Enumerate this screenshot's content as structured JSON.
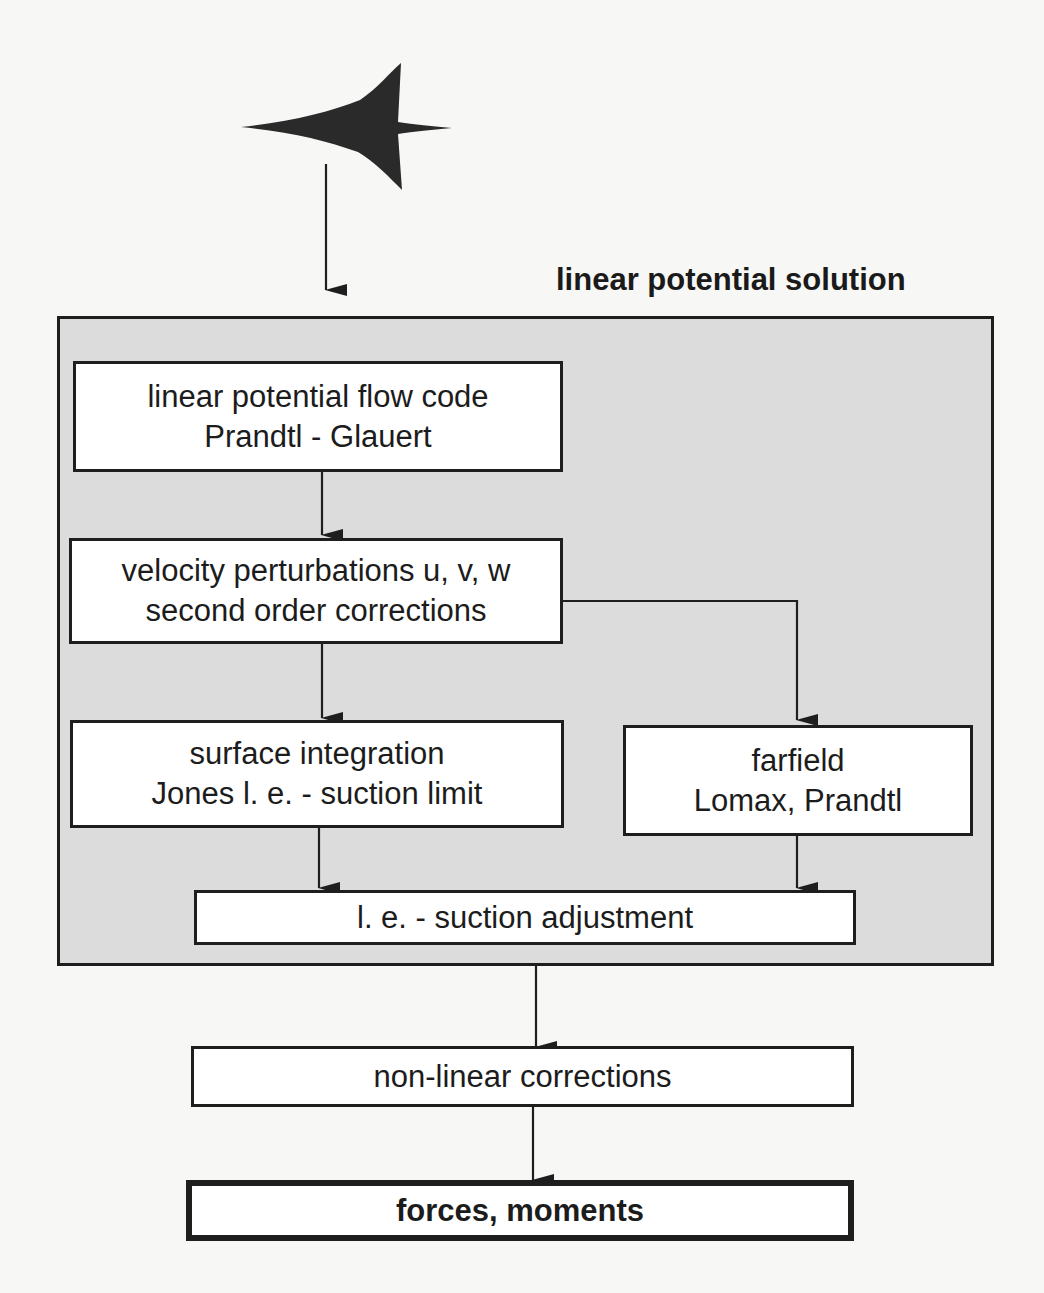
{
  "diagram": {
    "region": {
      "title": "linear potential solution"
    },
    "nodes": {
      "aircraft": {
        "icon": "aircraft-icon"
      },
      "flow_code": {
        "line1": "linear potential flow code",
        "line2": "Prandtl - Glauert"
      },
      "velocity": {
        "line1": "velocity perturbations u, v, w",
        "line2": "second order corrections"
      },
      "surface": {
        "line1": "surface integration",
        "line2": "Jones l. e. - suction limit"
      },
      "farfield": {
        "line1": "farfield",
        "line2": "Lomax, Prandtl"
      },
      "suction_adjust": {
        "line1": "l. e. - suction adjustment"
      },
      "nonlinear": {
        "line1": "non-linear corrections"
      },
      "forces": {
        "line1": "forces, moments"
      }
    },
    "edges": [
      [
        "aircraft",
        "flow_code"
      ],
      [
        "flow_code",
        "velocity"
      ],
      [
        "velocity",
        "surface"
      ],
      [
        "velocity",
        "farfield"
      ],
      [
        "surface",
        "suction_adjust"
      ],
      [
        "farfield",
        "suction_adjust"
      ],
      [
        "suction_adjust",
        "nonlinear"
      ],
      [
        "nonlinear",
        "forces"
      ]
    ],
    "colors": {
      "region_fill": "#dcdcdc",
      "box_fill": "#ffffff",
      "stroke": "#1e1e1e"
    }
  }
}
